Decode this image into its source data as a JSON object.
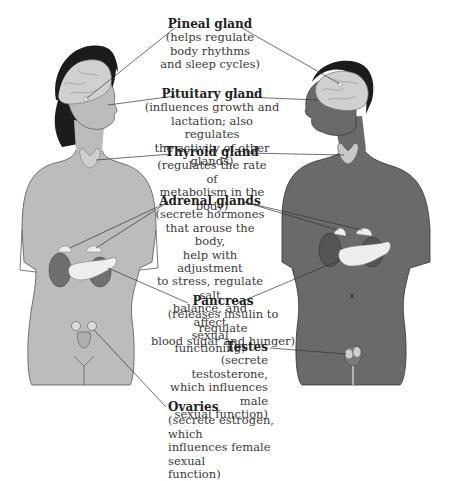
{
  "diagram": {
    "figures": [
      {
        "name": "female-figure",
        "tone": "#bdbdbd"
      },
      {
        "name": "male-figure",
        "tone": "#6b6b6b"
      }
    ],
    "colors": {
      "female_skin": "#bcbcbc",
      "male_skin": "#6a6a6a",
      "hair": "#1c1c1c",
      "brain": "#d0d0d0",
      "gland_light": "#eeeeee",
      "kidney": "#6f6f6f",
      "leader_line": "#333333"
    },
    "labels": [
      {
        "id": "pineal",
        "title": "Pineal gland",
        "desc": "(helps regulate\nbody rhythms\nand sleep cycles)"
      },
      {
        "id": "pituitary",
        "title": "Pituitary gland",
        "desc": "(influences growth and\nlactation; also regulates\nthe activity of other glands)"
      },
      {
        "id": "thyroid",
        "title": "Thyroid gland",
        "desc": "(regulates the rate of\nmetabolism in the body)"
      },
      {
        "id": "adrenal",
        "title": "Adrenal glands",
        "desc": "(secrete hormones\nthat arouse the body,\nhelp with adjustment\nto stress, regulate salt\nbalance, and affect\nsexual functioning)"
      },
      {
        "id": "pancreas",
        "title": "Pancreas",
        "desc": "(releases insulin to regulate\nblood sugar and hunger)"
      },
      {
        "id": "testes",
        "title": "Testes",
        "desc": "(secrete testosterone,\nwhich influences male\nsexual function)"
      },
      {
        "id": "ovaries",
        "title": "Ovaries",
        "desc": "(secrete estrogen, which\ninfluences female sexual\nfunction)"
      }
    ]
  }
}
